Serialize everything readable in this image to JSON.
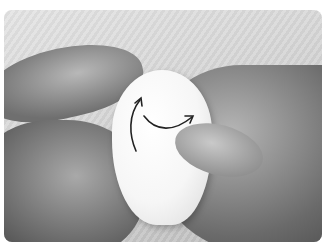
{
  "image": {
    "description": "Black-and-white photo of two hands shaping a white rounded piece of clay/fondant, with two curved black arrows indicating pressing/rotating motion.",
    "colors": {
      "arrow": "#222222",
      "clay": "#f5f5f5",
      "background": "#d8d8d8"
    }
  }
}
